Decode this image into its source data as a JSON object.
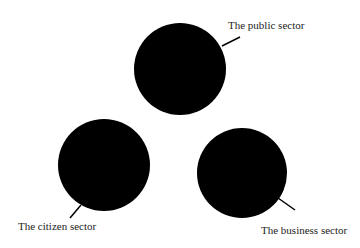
{
  "diagram": {
    "type": "three-sector",
    "nodes": [
      {
        "id": "public",
        "label": "The public sector",
        "cx": 180,
        "cy": 69,
        "r": 46
      },
      {
        "id": "citizen",
        "label": "The citizen sector",
        "cx": 104,
        "cy": 165,
        "r": 46
      },
      {
        "id": "business",
        "label": "The business sector",
        "cx": 242,
        "cy": 173,
        "r": 45
      }
    ],
    "colors": {
      "circle": "#000000",
      "text": "#222222",
      "background": "#ffffff"
    }
  }
}
